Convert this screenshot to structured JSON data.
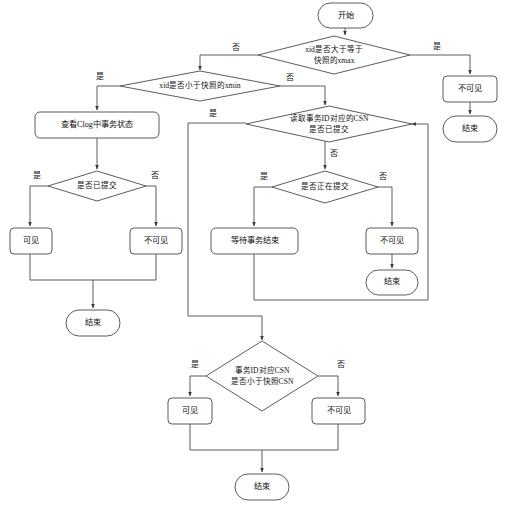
{
  "diagram": {
    "type": "flowchart",
    "background_color": "#ffffff",
    "line_color": "#4a4a4a",
    "text_color": "#111111",
    "nodes": {
      "start_top": "开始",
      "d_xmax": "xid是否大于等于",
      "d_xmax_2": "快照的xmax",
      "invisible_right": "不可见",
      "end_right": "结束",
      "d_xmin": "xid是否小于快照的xmin",
      "check_clog": "查看Clog中事务状态",
      "d_committed": "是否已提交",
      "visible_left": "可见",
      "invisible_left": "不可见",
      "end_left": "结束",
      "d_csn_committed": "读取事务ID对应的CSN",
      "d_csn_committed_2": "是否已提交",
      "d_committing": "是否正在提交",
      "wait_txn": "等待事务结束",
      "invisible_mid": "不可见",
      "end_mid": "结束",
      "d_csn_less": "事务ID对应CSN",
      "d_csn_less_2": "是否小于快照CSN",
      "visible_bottom": "可见",
      "invisible_bottom": "不可见",
      "end_bottom": "结束"
    },
    "edge_labels": {
      "xmax_no": "否",
      "xmax_yes": "是",
      "xmin_yes": "是",
      "xmin_no": "否",
      "committed_yes": "是",
      "committed_no": "否",
      "csn_committed_yes": "是",
      "csn_committed_no": "否",
      "committing_yes": "是",
      "committing_no": "否",
      "csn_less_yes": "是",
      "csn_less_no": "否"
    }
  }
}
